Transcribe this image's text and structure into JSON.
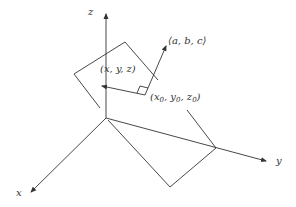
{
  "diagram": {
    "axes": {
      "x_label": "x",
      "y_label": "y",
      "z_label": "z"
    },
    "labels": {
      "normal_vector": "⟨a, b, c⟩",
      "point_general": "(x, y, z)",
      "point_base_prefix": "(x",
      "point_base_sub0": "0",
      "point_base_mid1": ", y",
      "point_base_sub1": "0",
      "point_base_mid2": ", z",
      "point_base_sub2": "0",
      "point_base_suffix": ")"
    },
    "colors": {
      "line": "#333333",
      "background": "#ffffff"
    }
  }
}
